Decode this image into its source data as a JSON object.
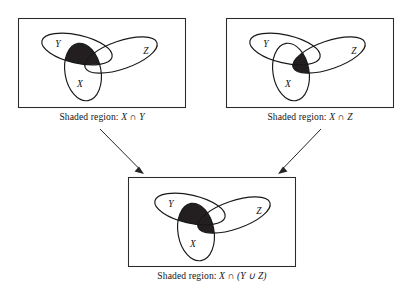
{
  "figure": {
    "background_color": "#ffffff",
    "line_color": "#181818",
    "shade_color": "#231f20",
    "panel_count": 3,
    "arrow_count": 2
  },
  "panels": [
    {
      "id": "panel-top-left",
      "position": "top-left",
      "set_labels": {
        "y": "Y",
        "z": "Z",
        "x": "X"
      },
      "caption": {
        "prefix": "Shaded region:",
        "expression": "X ∩ Y",
        "left_operand": "X",
        "operator": "∩",
        "right_operand": "Y"
      },
      "shaded_description": "intersection of X and Y"
    },
    {
      "id": "panel-top-right",
      "position": "top-right",
      "set_labels": {
        "y": "Y",
        "z": "Z",
        "x": "X"
      },
      "caption": {
        "prefix": "Shaded region:",
        "expression": "X ∩ Z",
        "left_operand": "X",
        "operator": "∩",
        "right_operand": "Z"
      },
      "shaded_description": "intersection of X and Z"
    },
    {
      "id": "panel-bottom",
      "position": "bottom-center",
      "set_labels": {
        "y": "Y",
        "z": "Z",
        "x": "X"
      },
      "caption": {
        "prefix": "Shaded region:",
        "expression": "X ∩ (Y ∪ Z)",
        "left_operand": "X",
        "operator": "∩",
        "right_operand": "(Y ∪ Z)"
      },
      "shaded_description": "intersection of X with the union of Y and Z"
    }
  ],
  "arrows": [
    {
      "id": "arrow-left",
      "from": "panel-top-left",
      "to": "panel-bottom",
      "direction": "down-right"
    },
    {
      "id": "arrow-right",
      "from": "panel-top-right",
      "to": "panel-bottom",
      "direction": "down-left"
    }
  ],
  "symbols": {
    "intersection": "∩",
    "union": "∪"
  }
}
